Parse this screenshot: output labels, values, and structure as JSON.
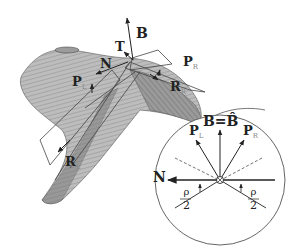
{
  "figure": {
    "main_labels": {
      "B": "B",
      "T": "T",
      "N": "N",
      "P_L": "P",
      "P_L_sub": "L",
      "P_R": "P",
      "P_R_sub": "R",
      "R_R": "R",
      "R_R_sub": "R",
      "R_L": "R",
      "R_L_sub": "L"
    },
    "inset": {
      "title": "B=B̂",
      "N": "N",
      "P_L": "P",
      "P_L_sub": "L",
      "P_R": "P",
      "P_R_sub": "R",
      "rho_left_num": "ρ",
      "rho_left_den": "2",
      "rho_right_num": "ρ",
      "rho_right_den": "2",
      "center_symbol": "⊗"
    },
    "colors": {
      "surface_light": "#b8b8b8",
      "surface_dark": "#8a8a8a",
      "line": "#333333",
      "plane": "#444444",
      "circle": "#555555"
    }
  }
}
